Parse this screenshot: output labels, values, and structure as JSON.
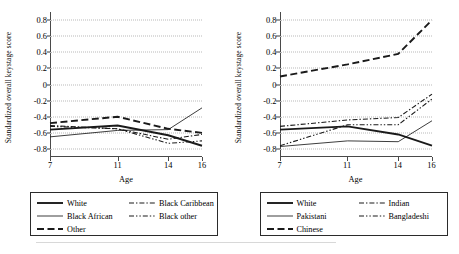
{
  "figure": {
    "background": "#ffffff",
    "axis_color": "#4a4a4a",
    "grid_color": "#b9b9b9",
    "series_color": "#1a1a1a"
  },
  "footer": {
    "fragment": ""
  },
  "chart_data": [
    {
      "type": "line",
      "panel": "left",
      "title": "",
      "xlabel": "Age",
      "ylabel": "Standardized overall keystage score",
      "x": [
        7,
        11,
        14,
        16
      ],
      "xticks": [
        "7",
        "11",
        "14",
        "16"
      ],
      "xlim": [
        7,
        16
      ],
      "ylim": [
        -0.9,
        0.9
      ],
      "yticks": [
        "0.8",
        "0.6",
        "0.4",
        "0.2",
        "0",
        "-0.2",
        "-0.4",
        "-0.6",
        "-0.8"
      ],
      "ytickvalues": [
        0.8,
        0.6,
        0.4,
        0.2,
        0,
        -0.2,
        -0.4,
        -0.6,
        -0.8
      ],
      "grid": true,
      "legend_position": "below",
      "series": [
        {
          "name": "White",
          "style": "solid-thick",
          "values": [
            -0.56,
            -0.51,
            -0.63,
            -0.76
          ]
        },
        {
          "name": "Black African",
          "style": "solid-thin",
          "values": [
            -0.65,
            -0.57,
            -0.56,
            -0.29
          ]
        },
        {
          "name": "Other",
          "style": "dashed",
          "values": [
            -0.48,
            -0.4,
            -0.55,
            -0.6
          ]
        },
        {
          "name": "Black Caribbean",
          "style": "dash-dot",
          "values": [
            -0.51,
            -0.55,
            -0.68,
            -0.62
          ]
        },
        {
          "name": "Black other",
          "style": "dash-dot-dot",
          "values": [
            -0.52,
            -0.55,
            -0.73,
            -0.7
          ]
        }
      ]
    },
    {
      "type": "line",
      "panel": "right",
      "title": "",
      "xlabel": "Age",
      "ylabel": "Standardized overall keystage score",
      "x": [
        7,
        11,
        14,
        16
      ],
      "xticks": [
        "7",
        "11",
        "14",
        "16"
      ],
      "xlim": [
        7,
        16
      ],
      "ylim": [
        -0.9,
        0.9
      ],
      "yticks": [
        "0.8",
        "0.6",
        "0.4",
        "0.2",
        "0",
        "-0.2",
        "-0.4",
        "-0.6",
        "-0.8"
      ],
      "ytickvalues": [
        0.8,
        0.6,
        0.4,
        0.2,
        0,
        -0.2,
        -0.4,
        -0.6,
        -0.8
      ],
      "grid": true,
      "legend_position": "below",
      "series": [
        {
          "name": "White",
          "style": "solid-thick",
          "values": [
            -0.56,
            -0.52,
            -0.62,
            -0.76
          ]
        },
        {
          "name": "Pakistani",
          "style": "solid-thin",
          "values": [
            -0.77,
            -0.7,
            -0.71,
            -0.45
          ]
        },
        {
          "name": "Chinese",
          "style": "dashed",
          "values": [
            0.1,
            0.25,
            0.38,
            0.8
          ]
        },
        {
          "name": "Indian",
          "style": "dash-dot",
          "values": [
            -0.52,
            -0.44,
            -0.41,
            -0.12
          ]
        },
        {
          "name": "Bangladeshi",
          "style": "dash-dot-dot",
          "values": [
            -0.76,
            -0.5,
            -0.5,
            -0.18
          ]
        }
      ]
    }
  ],
  "legends": [
    {
      "items": [
        {
          "label": "White",
          "style": "solid-thick"
        },
        {
          "label": "Black Caribbean",
          "style": "dash-dot"
        },
        {
          "label": "Black African",
          "style": "solid-thin"
        },
        {
          "label": "Black other",
          "style": "dash-dot-dot"
        },
        {
          "label": "Other",
          "style": "dashed"
        }
      ]
    },
    {
      "items": [
        {
          "label": "White",
          "style": "solid-thick"
        },
        {
          "label": "Indian",
          "style": "dash-dot"
        },
        {
          "label": "Pakistani",
          "style": "solid-thin"
        },
        {
          "label": "Bangladeshi",
          "style": "dash-dot-dot"
        },
        {
          "label": "Chinese",
          "style": "dashed"
        }
      ]
    }
  ]
}
